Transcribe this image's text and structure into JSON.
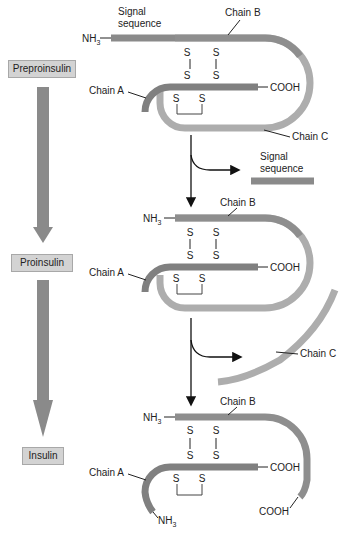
{
  "stages": [
    {
      "label": "Preproinsulin"
    },
    {
      "label": "Proinsulin"
    },
    {
      "label": "Insulin"
    }
  ],
  "labels": {
    "nh3": "NH",
    "nh3_sub": "3",
    "cooh": "COOH",
    "chain_a": "Chain A",
    "chain_b": "Chain B",
    "chain_c": "Chain C",
    "signal_sequence_line1": "Signal",
    "signal_sequence_line2": "sequence",
    "sulfur": "S"
  },
  "colors": {
    "signal_sequence": "#8a8a8a",
    "chain_b": "#8e8e8e",
    "chain_a": "#808080",
    "chain_c": "#adadad",
    "stage_box": "#d3d3d3",
    "stage_arrow": "#8a8a8a"
  }
}
